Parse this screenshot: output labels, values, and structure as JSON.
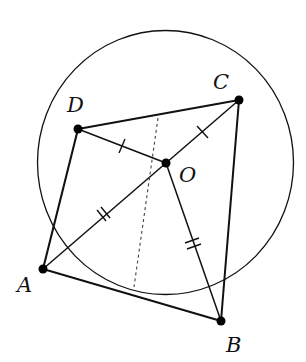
{
  "figure": {
    "stroke_color": "#111111",
    "background": "#ffffff",
    "circle": {
      "cx": 165.5,
      "cy": 162.5,
      "rx": 128,
      "ry": 132
    },
    "points": {
      "A": {
        "label": "A",
        "x": 43,
        "y": 269
      },
      "B": {
        "label": "B",
        "x": 221,
        "y": 321
      },
      "C": {
        "label": "C",
        "x": 239,
        "y": 100
      },
      "D": {
        "label": "D",
        "x": 78,
        "y": 129
      },
      "O": {
        "label": "O",
        "x": 166,
        "y": 163
      }
    },
    "labels": {
      "A": "A",
      "B": "B",
      "C": "C",
      "D": "D",
      "O": "O"
    },
    "segments": [
      "AB",
      "BC",
      "CD",
      "DA",
      "OA",
      "OB",
      "OC",
      "OD"
    ],
    "tick_marks": {
      "OD": "single",
      "OC": "single",
      "OA": "double",
      "OB": "double"
    },
    "dashed_line": {
      "from": {
        "x": 158,
        "y": 118
      },
      "to": {
        "x": 134,
        "y": 287
      }
    }
  }
}
